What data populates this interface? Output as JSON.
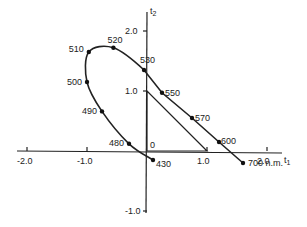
{
  "diagram": {
    "x_axis": {
      "label": "t",
      "sub": "1",
      "ticks": [
        {
          "value": -2.0,
          "label": "-2.0"
        },
        {
          "value": -1.0,
          "label": "-1.0"
        },
        {
          "value": 1.0,
          "label": "1.0"
        },
        {
          "value": 2.0,
          "label": "2.0"
        }
      ]
    },
    "y_axis": {
      "label": "t",
      "sub": "2",
      "ticks": [
        {
          "value": 2.0,
          "label": "2.0"
        },
        {
          "value": 1.0,
          "label": "1.0"
        },
        {
          "value": -1.0,
          "label": "-1.0"
        }
      ]
    },
    "origin_label": "0",
    "locus_points": [
      {
        "label": "430",
        "x": 0.1,
        "y": -0.15
      },
      {
        "label": "480",
        "x": -0.3,
        "y": 0.12
      },
      {
        "label": "490",
        "x": -0.75,
        "y": 0.66
      },
      {
        "label": "500",
        "x": -1.0,
        "y": 1.15
      },
      {
        "label": "510",
        "x": -0.97,
        "y": 1.65
      },
      {
        "label": "520",
        "x": -0.56,
        "y": 1.72
      },
      {
        "label": "530",
        "x": -0.05,
        "y": 1.35
      },
      {
        "label": "550",
        "x": 0.25,
        "y": 0.97
      },
      {
        "label": "570",
        "x": 0.75,
        "y": 0.55
      },
      {
        "label": "600",
        "x": 1.2,
        "y": 0.15
      },
      {
        "label": "700 n.m.",
        "x": 1.6,
        "y": -0.2
      }
    ],
    "triangle": [
      [
        0,
        0
      ],
      [
        0,
        1.0
      ],
      [
        1.0,
        0
      ]
    ]
  }
}
